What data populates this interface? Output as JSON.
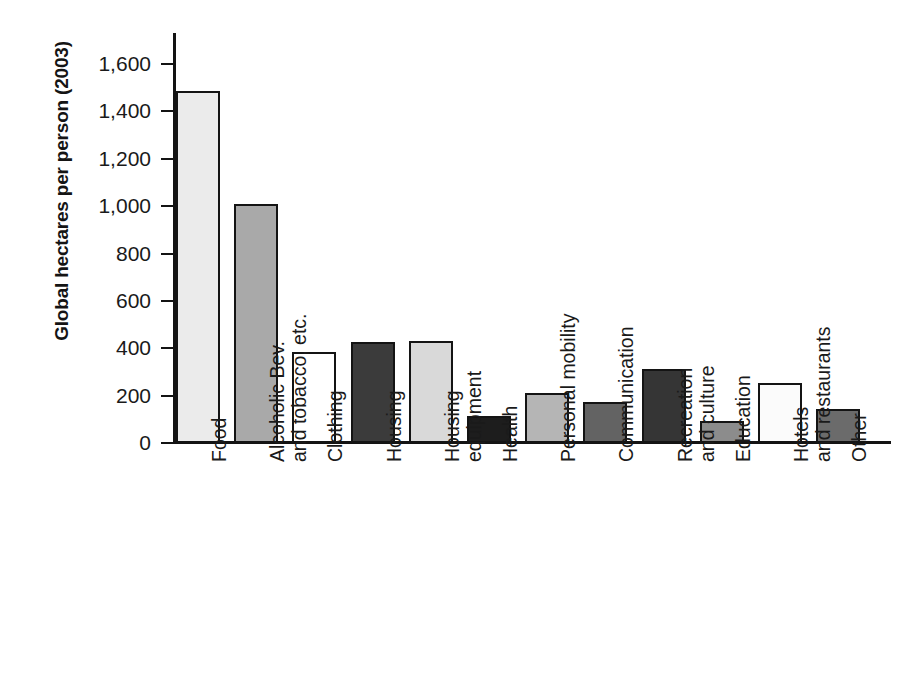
{
  "chart_data": {
    "type": "bar",
    "title": "",
    "subtitle": "",
    "xlabel": "",
    "ylabel": "Global hectares per person (2003)",
    "ylim": [
      0,
      1600
    ],
    "ytick_values": [
      1600,
      1400,
      1200,
      1000,
      800,
      600,
      400,
      200,
      0
    ],
    "ytick_labels": [
      "1,600",
      "1,400",
      "1,200",
      "1,000",
      "800",
      "600",
      "400",
      "200",
      "0"
    ],
    "grid": false,
    "legend": "none",
    "categories": [
      "Food",
      "Alcoholic Bev. and tobacco, etc.",
      "Clothing",
      "Housing",
      "Housing equipment",
      "Health",
      "Personal mobility",
      "Communication",
      "Recreation and culture",
      "Education",
      "Hotels and restaurants",
      "Other"
    ],
    "category_label_lines": [
      [
        "Food"
      ],
      [
        "Alcoholic Bev.",
        "and tobacco, etc."
      ],
      [
        "Clothing"
      ],
      [
        "Housing"
      ],
      [
        "Housing",
        "equipment"
      ],
      [
        "Health"
      ],
      [
        "Personal mobility"
      ],
      [
        "Communication"
      ],
      [
        "Recreation",
        "and culture"
      ],
      [
        "Education"
      ],
      [
        "Hotels",
        "and restaurants"
      ],
      [
        "Other"
      ]
    ],
    "values": [
      1487,
      1007,
      385,
      427,
      431,
      112,
      211,
      172,
      314,
      92,
      253,
      144
    ],
    "bar_colors": [
      "#ebebeb",
      "#a9a9a9",
      "#ffffff",
      "#3b3b3b",
      "#d9d9d9",
      "#1d1d1d",
      "#b5b5b5",
      "#636363",
      "#353535",
      "#8c8c8c",
      "#fbfbfb",
      "#6b6b6b"
    ],
    "bar_edge_color": "#141414",
    "axis_color": "#131313",
    "background_color": "#ffffff"
  }
}
